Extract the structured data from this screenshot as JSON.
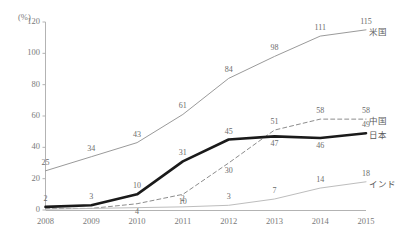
{
  "chart_data": {
    "type": "line",
    "title": "",
    "xlabel": "",
    "ylabel": "(%)",
    "unit_label": "(%)",
    "categories": [
      "2008",
      "2009",
      "2010",
      "2011",
      "2012",
      "2013",
      "2014",
      "2015"
    ],
    "x": [
      2008,
      2009,
      2010,
      2011,
      2012,
      2013,
      2014,
      2015
    ],
    "ylim": [
      0,
      120
    ],
    "yticks": [
      "0",
      "20",
      "40",
      "60",
      "80",
      "100",
      "120"
    ],
    "ytick_values": [
      0,
      20,
      40,
      60,
      80,
      100,
      120
    ],
    "grid": false,
    "legend_position": "right-of-line-ends",
    "series": [
      {
        "name": "米国",
        "label": "米国",
        "color": "#9a9a9a",
        "style": "solid-thin",
        "values": [
          25,
          34,
          43,
          61,
          84,
          98,
          111,
          115
        ],
        "data_labels": [
          "25",
          "34",
          "43",
          "61",
          "84",
          "98",
          "111",
          "115"
        ]
      },
      {
        "name": "中国",
        "label": "中国",
        "color": "#8c8c8c",
        "style": "dashed",
        "values": [
          1,
          1,
          4,
          10,
          30,
          51,
          58,
          58
        ],
        "data_labels": [
          "",
          "",
          "4",
          "10",
          "30",
          "51",
          "58",
          "58"
        ]
      },
      {
        "name": "日本",
        "label": "日本",
        "color": "#1a1a1a",
        "style": "solid-thick",
        "values": [
          2,
          3,
          10,
          31,
          45,
          47,
          46,
          49
        ],
        "data_labels": [
          "2",
          "3",
          "10",
          "31",
          "45",
          "47",
          "46",
          "49"
        ]
      },
      {
        "name": "インド",
        "label": "インド",
        "color": "#bdbdbd",
        "style": "solid-thin",
        "values": [
          0.5,
          1,
          1.5,
          2,
          3,
          7,
          14,
          18
        ],
        "data_labels": [
          "",
          "",
          "",
          "2",
          "3",
          "7",
          "14",
          "18"
        ]
      }
    ]
  }
}
